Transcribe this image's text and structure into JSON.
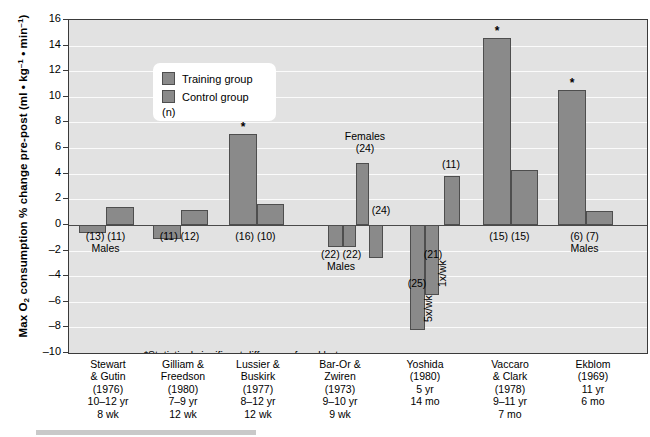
{
  "axis": {
    "y_title_pre": "Max O",
    "y_title_sub": "2",
    "y_title_mid": " consumption % change pre-post (ml • kg",
    "y_title_sup1": "–1",
    "y_title_mid2": " • min",
    "y_title_sup2": "–1",
    "y_title_end": ")",
    "y_ticks": [
      "16",
      "14",
      "12",
      "10",
      "8",
      "6",
      "4",
      "2",
      "0",
      "–2",
      "–4",
      "–6",
      "–8",
      "–10"
    ]
  },
  "legend": {
    "training_label": "Training group",
    "control_label": "Control group",
    "n_label": "(n)"
  },
  "footnote": "*Statistical significant difference found between groups",
  "chart_data": {
    "type": "bar",
    "title": "",
    "xlabel": "",
    "ylabel": "Max O2 consumption % change pre-post (ml • kg-1 • min-1)",
    "ylim": [
      -10,
      16
    ],
    "ytick_step": 2,
    "grid": true,
    "legend_position": "upper-left-inside",
    "series": [
      {
        "name": "Training group",
        "color": "#8a8a8a"
      },
      {
        "name": "Control group",
        "color": "#8a8a8a"
      }
    ],
    "groups": [
      {
        "study": "Stewart & Gutin",
        "year": "(1976)",
        "age": "10–12 yr",
        "duration": "8 wk",
        "note": "Males",
        "x_lines": [
          "Stewart",
          "& Gutin",
          "(1976)",
          "10–12 yr",
          "8 wk"
        ],
        "n_text": "(13) (11)",
        "bars": [
          {
            "group": "Training group",
            "value": -0.6,
            "n": 13,
            "significant": false,
            "label": ""
          },
          {
            "group": "Control group",
            "value": 1.4,
            "n": 11,
            "significant": false,
            "label": ""
          }
        ]
      },
      {
        "study": "Gilliam & Freedson",
        "year": "(1980)",
        "age": "7–9 yr",
        "duration": "12 wk",
        "note": "",
        "x_lines": [
          "Gilliam &",
          "Freedson",
          "(1980)",
          "7–9 yr",
          "12 wk"
        ],
        "n_text": "(11) (12)",
        "bars": [
          {
            "group": "Training group",
            "value": -1.1,
            "n": 11,
            "significant": false,
            "label": ""
          },
          {
            "group": "Control group",
            "value": 1.2,
            "n": 12,
            "significant": false,
            "label": ""
          }
        ]
      },
      {
        "study": "Lussier & Buskirk",
        "year": "(1977)",
        "age": "8–12 yr",
        "duration": "12 wk",
        "note": "",
        "x_lines": [
          "Lussier &",
          "Buskirk",
          "(1977)",
          "8–12 yr",
          "12 wk"
        ],
        "n_text": "(16) (10)",
        "bars": [
          {
            "group": "Training group",
            "value": 7.1,
            "n": 16,
            "significant": true,
            "label": ""
          },
          {
            "group": "Control group",
            "value": 1.6,
            "n": 10,
            "significant": false,
            "label": ""
          }
        ]
      },
      {
        "study": "Bar-Or & Zwiren",
        "year": "(1973)",
        "age": "9–10 yr",
        "duration": "9 wk",
        "note": "Males / Females",
        "x_lines": [
          "Bar-Or &",
          "Zwiren",
          "(1973)",
          "9–10 yr",
          "9 wk"
        ],
        "n_text": "(22) (22)",
        "bars": [
          {
            "group": "Training group",
            "value": -1.7,
            "n": 22,
            "significant": false,
            "label": "Males"
          },
          {
            "group": "Control group",
            "value": -1.7,
            "n": 22,
            "significant": false,
            "label": "Males"
          },
          {
            "group": "Training group",
            "value": 4.8,
            "n": 24,
            "significant": false,
            "label": "Females"
          },
          {
            "group": "Control group",
            "value": -2.6,
            "n": 24,
            "significant": false,
            "label": ""
          }
        ]
      },
      {
        "study": "Yoshida",
        "year": "(1980)",
        "age": "5 yr",
        "duration": "14 mo",
        "note": "",
        "x_lines": [
          "Yoshida",
          "(1980)",
          "5 yr",
          "14 mo"
        ],
        "n_text": "",
        "bars": [
          {
            "group": "Training group",
            "value": -8.2,
            "n": 25,
            "significant": false,
            "label": "5x/wk"
          },
          {
            "group": "Training group",
            "value": -5.5,
            "n": 21,
            "significant": false,
            "label": "1x/wk"
          },
          {
            "group": "Control group",
            "value": 3.8,
            "n": 11,
            "significant": false,
            "label": ""
          }
        ]
      },
      {
        "study": "Vaccaro & Clark",
        "year": "(1978)",
        "age": "9–11 yr",
        "duration": "7 mo",
        "note": "",
        "x_lines": [
          "Vaccaro",
          "& Clark",
          "(1978)",
          "9–11 yr",
          "7 mo"
        ],
        "n_text": "(15) (15)",
        "bars": [
          {
            "group": "Training group",
            "value": 14.6,
            "n": 15,
            "significant": true,
            "label": ""
          },
          {
            "group": "Control group",
            "value": 4.3,
            "n": 15,
            "significant": false,
            "label": ""
          }
        ]
      },
      {
        "study": "Ekblom",
        "year": "(1969)",
        "age": "11 yr",
        "duration": "6 mo",
        "note": "Males",
        "x_lines": [
          "Ekblom",
          "(1969)",
          "11 yr",
          "6 mo"
        ],
        "n_text": "(6) (7)",
        "bars": [
          {
            "group": "Training group",
            "value": 10.5,
            "n": 6,
            "significant": true,
            "label": ""
          },
          {
            "group": "Control group",
            "value": 1.1,
            "n": 7,
            "significant": false,
            "label": ""
          }
        ]
      }
    ],
    "annotations": [
      {
        "text": "Males",
        "group_index": 0
      },
      {
        "text": "Males",
        "group_index": 3
      },
      {
        "text": "Females",
        "group_index": 3
      },
      {
        "text": "(24)",
        "group_index": 3
      },
      {
        "text": "(24)",
        "group_index": 3
      },
      {
        "text": "(25)",
        "group_index": 4
      },
      {
        "text": "(21)",
        "group_index": 4
      },
      {
        "text": "(11)",
        "group_index": 4
      },
      {
        "text": "Males",
        "group_index": 6
      }
    ]
  }
}
